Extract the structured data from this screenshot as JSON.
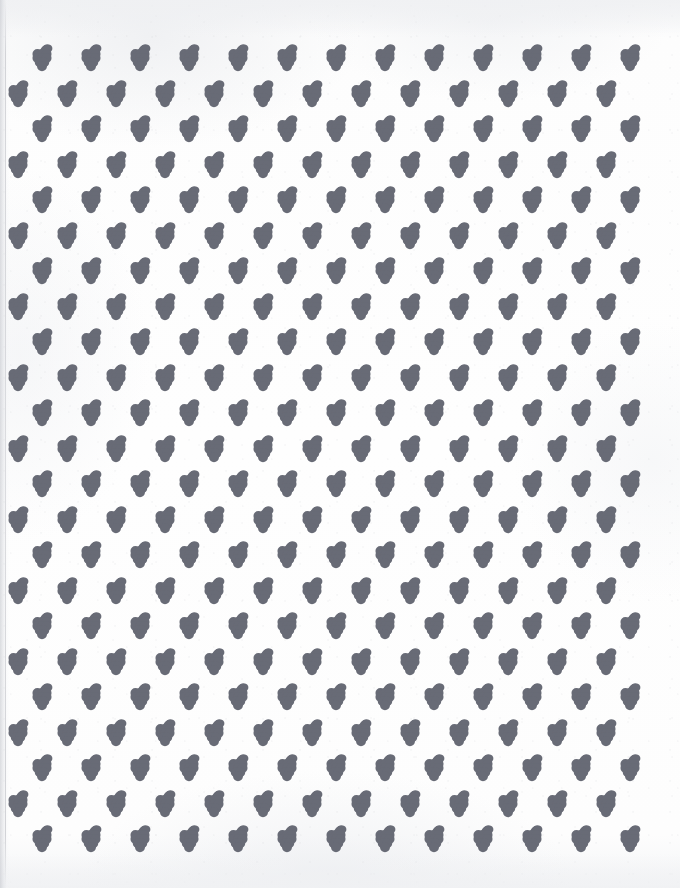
{
  "document": {
    "kind": "scanned-pattern-sheet",
    "subject": "grape cluster repeating motif",
    "width": 680,
    "height": 888,
    "background_color": "#fdfdfd",
    "ink_color": "#686b76",
    "scan_edge_color": "#c6c8ce"
  },
  "motif": {
    "name": "grape-cluster",
    "description": "Outline drawing of a bunch of grapes with a curved stem and a curled tendril at the upper right.",
    "berry_rows": [
      3,
      3,
      2,
      1
    ],
    "berry_count": 9,
    "has_stem": true,
    "has_tendril": true,
    "width_px": 22,
    "height_px": 26,
    "stroke_color": "#686b76",
    "stroke_width_px": 0.9
  },
  "pattern": {
    "layout": "half-drop staggered grid",
    "column_pitch_px": 49,
    "row_pitch_px": 35.5,
    "row_count": 23,
    "columns_per_even_row": 13,
    "columns_per_odd_row": 13,
    "even_row_first_x": 42,
    "odd_row_first_x": 18,
    "first_row_y": 57,
    "total_motifs": 299
  },
  "margins": {
    "top_px": 38,
    "bottom_px": 34,
    "left_scan_edge_px": 9,
    "right_px": 18
  }
}
